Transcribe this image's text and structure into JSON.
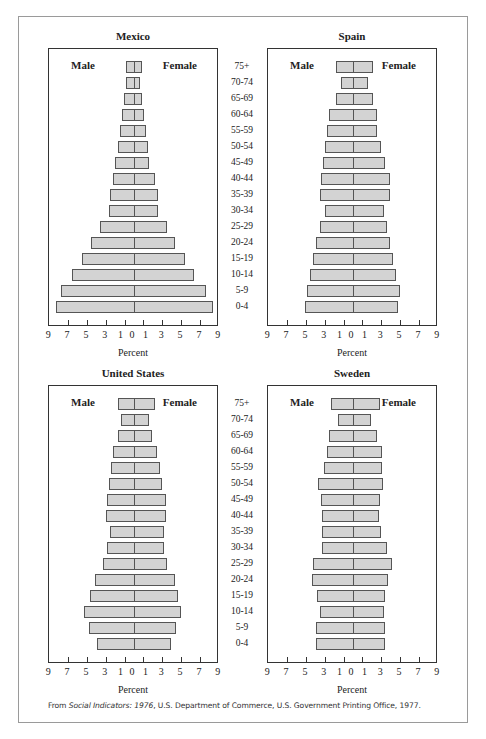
{
  "chart_data": [
    {
      "type": "bar",
      "subtype": "population-pyramid",
      "title": "Mexico",
      "xlabel": "Percent",
      "xticks": [
        "9",
        "7",
        "5",
        "3",
        "1",
        "0",
        "1",
        "3",
        "5",
        "7",
        "9"
      ],
      "xlim": [
        -9,
        9
      ],
      "legend": [
        "Male",
        "Female"
      ],
      "categories": [
        "75+",
        "70-74",
        "65-69",
        "60-64",
        "55-59",
        "50-54",
        "45-49",
        "40-44",
        "35-39",
        "30-34",
        "25-29",
        "20-24",
        "15-19",
        "10-14",
        "5-9",
        "0-4"
      ],
      "series": [
        {
          "name": "Male",
          "values": [
            0.9,
            0.8,
            1.1,
            1.25,
            1.5,
            1.75,
            2.0,
            2.2,
            2.5,
            2.7,
            3.6,
            4.6,
            5.5,
            6.6,
            7.8,
            8.3
          ]
        },
        {
          "name": "Female",
          "values": [
            0.85,
            0.6,
            0.85,
            1.1,
            1.25,
            1.45,
            1.6,
            2.2,
            2.5,
            2.6,
            3.5,
            4.3,
            5.4,
            6.4,
            7.6,
            8.4
          ]
        }
      ]
    },
    {
      "type": "bar",
      "subtype": "population-pyramid",
      "title": "Spain",
      "xlabel": "Percent",
      "xticks": [
        "9",
        "7",
        "5",
        "3",
        "1",
        "0",
        "1",
        "3",
        "5",
        "7",
        "9"
      ],
      "xlim": [
        -9,
        9
      ],
      "legend": [
        "Male",
        "Female"
      ],
      "categories": [
        "75+",
        "70-74",
        "65-69",
        "60-64",
        "55-59",
        "50-54",
        "45-49",
        "40-44",
        "35-39",
        "30-34",
        "25-29",
        "20-24",
        "15-19",
        "10-14",
        "5-9",
        "0-4"
      ],
      "series": [
        {
          "name": "Male",
          "values": [
            1.8,
            1.3,
            1.8,
            2.5,
            2.8,
            3.0,
            3.2,
            3.4,
            3.5,
            3.0,
            3.5,
            3.9,
            4.2,
            4.6,
            4.9,
            5.1
          ]
        },
        {
          "name": "Female",
          "values": [
            2.1,
            1.6,
            2.1,
            2.5,
            2.6,
            3.0,
            3.4,
            3.9,
            3.9,
            3.3,
            3.6,
            3.9,
            4.2,
            4.6,
            5.0,
            4.8
          ]
        }
      ]
    },
    {
      "type": "bar",
      "subtype": "population-pyramid",
      "title": "United States",
      "xlabel": "Percent",
      "xticks": [
        "9",
        "7",
        "5",
        "3",
        "1",
        "0",
        "1",
        "3",
        "5",
        "7",
        "9"
      ],
      "xlim": [
        -9,
        9
      ],
      "legend": [
        "Male",
        "Female"
      ],
      "categories": [
        "75+",
        "70-74",
        "65-69",
        "60-64",
        "55-59",
        "50-54",
        "45-49",
        "40-44",
        "35-39",
        "30-34",
        "25-29",
        "20-24",
        "15-19",
        "10-14",
        "5-9",
        "0-4"
      ],
      "series": [
        {
          "name": "Male",
          "values": [
            1.7,
            1.4,
            1.75,
            2.2,
            2.45,
            2.7,
            2.9,
            3.0,
            2.5,
            2.9,
            3.3,
            4.1,
            4.7,
            5.3,
            4.8,
            3.9
          ]
        },
        {
          "name": "Female",
          "values": [
            2.2,
            1.6,
            1.9,
            2.4,
            2.8,
            3.0,
            3.4,
            3.4,
            3.2,
            3.2,
            3.5,
            4.3,
            4.7,
            5.0,
            4.5,
            3.9
          ]
        }
      ]
    },
    {
      "type": "bar",
      "subtype": "population-pyramid",
      "title": "Sweden",
      "xlabel": "Percent",
      "xticks": [
        "9",
        "7",
        "5",
        "3",
        "1",
        "0",
        "1",
        "3",
        "5",
        "7",
        "9"
      ],
      "xlim": [
        -9,
        9
      ],
      "legend": [
        "Male",
        "Female"
      ],
      "categories": [
        "75+",
        "70-74",
        "65-69",
        "60-64",
        "55-59",
        "50-54",
        "45-49",
        "40-44",
        "35-39",
        "30-34",
        "25-29",
        "20-24",
        "15-19",
        "10-14",
        "5-9",
        "0-4"
      ],
      "series": [
        {
          "name": "Male",
          "values": [
            2.35,
            1.6,
            2.55,
            2.8,
            3.1,
            3.7,
            3.4,
            3.3,
            3.3,
            3.3,
            4.2,
            4.4,
            3.8,
            3.5,
            3.9,
            3.9
          ]
        },
        {
          "name": "Female",
          "values": [
            2.9,
            1.9,
            2.5,
            3.05,
            3.05,
            3.2,
            2.9,
            2.8,
            3.0,
            3.6,
            4.1,
            3.7,
            3.4,
            3.3,
            3.45,
            3.45
          ]
        }
      ]
    }
  ],
  "panels": [
    {
      "title": "Mexico",
      "male_label": "Male",
      "female_label": "Female",
      "xlabel": "Percent"
    },
    {
      "title": "Spain",
      "male_label": "Male",
      "female_label": "Female",
      "xlabel": "Percent"
    },
    {
      "title": "United States",
      "male_label": "Male",
      "female_label": "Female",
      "xlabel": "Percent"
    },
    {
      "title": "Sweden",
      "male_label": "Male",
      "female_label": "Female",
      "xlabel": "Percent"
    }
  ],
  "age_groups": [
    "75+",
    "70-74",
    "65-69",
    "60-64",
    "55-59",
    "50-54",
    "45-49",
    "40-44",
    "35-39",
    "30-34",
    "25-29",
    "20-24",
    "15-19",
    "10-14",
    "5-9",
    "0-4"
  ],
  "footer": {
    "prefix": "From ",
    "source_title": "Social Indicators: 1976",
    "suffix": ", U.S. Department of Commerce, U.S. Government Printing Office, 1977."
  },
  "colors": {
    "bar_fill": "#d3d3d3",
    "bar_stroke": "#555555",
    "frame": "#9a9a9a",
    "box": "#333333"
  }
}
